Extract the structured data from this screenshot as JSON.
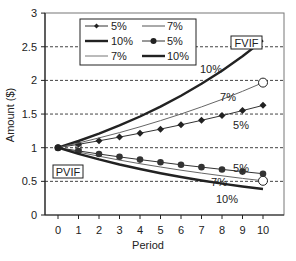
{
  "chart_data": {
    "type": "line",
    "title": "",
    "xlabel": "Period",
    "ylabel": "Amount ($)",
    "xlim": [
      0,
      10
    ],
    "ylim": [
      0,
      3
    ],
    "x": [
      0,
      1,
      2,
      3,
      4,
      5,
      6,
      7,
      8,
      9,
      10
    ],
    "x_ticks": [
      "0",
      "1",
      "2",
      "3",
      "4",
      "5",
      "6",
      "7",
      "8",
      "9",
      "10"
    ],
    "y_ticks": [
      "0",
      "0.5",
      "1",
      "1.5",
      "2",
      "2.5",
      "3"
    ],
    "grid": "horizontal dashed",
    "legend_position": "top-left inside",
    "series": [
      {
        "name": "5%",
        "group": "FVIF",
        "marker": "diamond",
        "style": "thin dark",
        "values": [
          1.0,
          1.05,
          1.103,
          1.158,
          1.216,
          1.276,
          1.34,
          1.407,
          1.477,
          1.551,
          1.629
        ]
      },
      {
        "name": "10%",
        "group": "FVIF",
        "marker": "none",
        "style": "thick",
        "values": [
          1.0,
          1.1,
          1.21,
          1.331,
          1.464,
          1.611,
          1.772,
          1.949,
          2.144,
          2.358,
          2.594
        ]
      },
      {
        "name": "7%",
        "group": "FVIF",
        "marker": "none",
        "style": "thin",
        "values": [
          1.0,
          1.07,
          1.145,
          1.225,
          1.311,
          1.403,
          1.501,
          1.606,
          1.718,
          1.838,
          1.967
        ]
      },
      {
        "name": "7%",
        "group": "PVIF",
        "marker": "none",
        "style": "thin",
        "values": [
          1.0,
          0.935,
          0.873,
          0.816,
          0.763,
          0.713,
          0.666,
          0.623,
          0.582,
          0.544,
          0.508
        ]
      },
      {
        "name": "5%",
        "group": "PVIF",
        "marker": "circle",
        "style": "thin dark",
        "values": [
          1.0,
          0.952,
          0.907,
          0.864,
          0.823,
          0.784,
          0.746,
          0.711,
          0.677,
          0.645,
          0.614
        ]
      },
      {
        "name": "10%",
        "group": "PVIF",
        "marker": "none",
        "style": "thick",
        "values": [
          1.0,
          0.909,
          0.826,
          0.751,
          0.683,
          0.621,
          0.564,
          0.513,
          0.467,
          0.424,
          0.386
        ]
      }
    ],
    "annotations": [
      {
        "text": "FVIF",
        "boxed": true
      },
      {
        "text": "PVIF",
        "boxed": true
      },
      {
        "text": "10%",
        "near": "FVIF 10%"
      },
      {
        "text": "7%",
        "near": "FVIF 7%"
      },
      {
        "text": "5%",
        "near": "FVIF 5%"
      },
      {
        "text": "5%",
        "near": "PVIF 5%"
      },
      {
        "text": "7%",
        "near": "PVIF 7%"
      },
      {
        "text": "10%",
        "near": "PVIF 10%"
      }
    ]
  },
  "legend": {
    "items": [
      {
        "label": "5%"
      },
      {
        "label": "7%"
      },
      {
        "label": "10%"
      },
      {
        "label": "5%"
      },
      {
        "label": "7%"
      },
      {
        "label": "10%"
      }
    ]
  },
  "labels": {
    "fvif": "FVIF",
    "pvif": "PVIF",
    "fv10": "10%",
    "fv7": "7%",
    "fv5": "5%",
    "pv5": "5%",
    "pv7": "7%",
    "pv10": "10%",
    "xlabel": "Period",
    "ylabel": "Amount ($)"
  }
}
